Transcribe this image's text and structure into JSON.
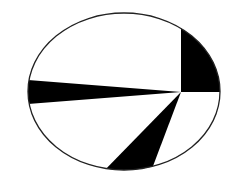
{
  "chart_data": {
    "type": "pie",
    "title": "",
    "shape": "ellipse",
    "ellipse": {
      "cx": 124,
      "cy": 91.5,
      "rx": 96,
      "ry": 78.5
    },
    "hub": {
      "x": 181,
      "y": 92
    },
    "slices": [
      {
        "label": "",
        "start_deg": 0,
        "end_deg": 90,
        "fill": "#000000"
      },
      {
        "label": "",
        "start_deg": 90,
        "end_deg": 175.5,
        "fill": "#ffffff"
      },
      {
        "label": "",
        "start_deg": 175.5,
        "end_deg": 184.5,
        "fill": "#000000"
      },
      {
        "label": "",
        "start_deg": 184.5,
        "end_deg": 225.7,
        "fill": "#ffffff"
      },
      {
        "label": "",
        "start_deg": 225.7,
        "end_deg": 249.3,
        "fill": "#000000"
      },
      {
        "label": "",
        "start_deg": 249.3,
        "end_deg": 360,
        "fill": "#ffffff"
      }
    ],
    "approx_fraction_by_angle": [
      0.25,
      0.2375,
      0.025,
      0.1144,
      0.0656,
      0.3075
    ],
    "stroke": "#222222",
    "legend": null
  },
  "colors": {
    "background": "#ffffff",
    "ink": "#000000",
    "outline": "#222222"
  }
}
